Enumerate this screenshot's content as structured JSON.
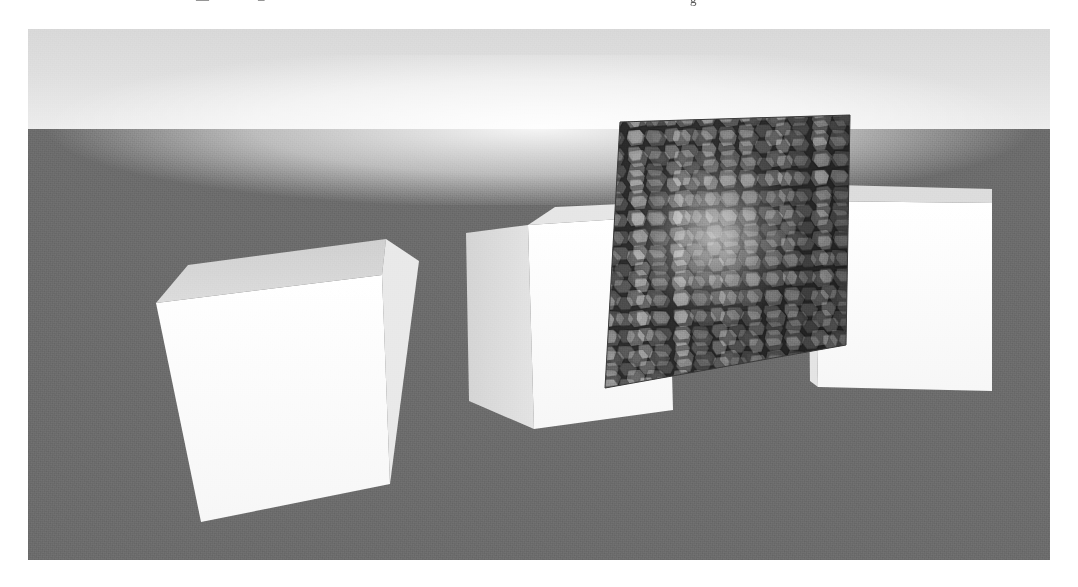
{
  "figure": {
    "domain": "render",
    "kind": "3d-rendered-scene",
    "top_text_fragments": [
      "—",
      "–",
      "g"
    ]
  },
  "scene": {
    "background": {
      "name": "sky-gradient-backdrop",
      "top_color": "#d8d8d8",
      "glow_color": "#ffffff",
      "horizon_y": 100,
      "ground_color": "#6b6b6b"
    },
    "ground": {
      "name": "ground-plane",
      "color": "#6b6b6b"
    },
    "objects": [
      {
        "id": "box-left",
        "label": "left white box",
        "material": "diffuse-white",
        "front_color": "#fdfdfd",
        "top_color": "#d2d2d2",
        "side_color": "#e8e8e8"
      },
      {
        "id": "box-middle",
        "label": "middle white box",
        "material": "diffuse-white",
        "front_color": "#fcfcfc",
        "top_color": "#e0e0e0",
        "side_color": "#d8d8d8"
      },
      {
        "id": "box-right",
        "label": "right white box",
        "material": "diffuse-white",
        "front_color": "#fbfbfb",
        "top_color": "#dcdcdc",
        "side_color": "#e4e4e4"
      },
      {
        "id": "texture-panel",
        "label": "textured quad",
        "material": "voronoi-cobblestone",
        "mortar_color": "#262626",
        "stone_light": "#cfcfcf",
        "stone_mid": "#8a8a8a",
        "stone_dark": "#4a4a4a",
        "cells_across": 11,
        "cells_down": 15
      }
    ],
    "viewport": {
      "x": 28,
      "y": 29,
      "width": 1022,
      "height": 531
    }
  }
}
